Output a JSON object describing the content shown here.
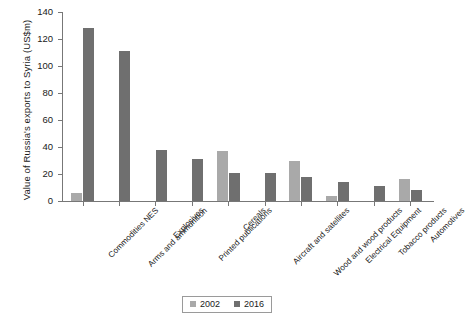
{
  "chart_data": {
    "type": "bar",
    "title": "",
    "xlabel": "",
    "ylabel": "Value of Russia's exports to Syria (US$m)",
    "ylim": [
      0,
      140
    ],
    "yticks": [
      0,
      20,
      40,
      60,
      80,
      100,
      120,
      140
    ],
    "grid": false,
    "legend_position": "bottom-center",
    "categories": [
      "Commodities NES",
      "Arms and ammunition",
      "Explosives",
      "Printed publications",
      "Cereals",
      "Aircraft and satellites",
      "Wood and wood products",
      "Electrical Equipment",
      "Tobacco products",
      "Automotives"
    ],
    "series": [
      {
        "name": "2002",
        "color": "#a9a9a9",
        "values": [
          6,
          0,
          0,
          0,
          37,
          0,
          30,
          4,
          0,
          16
        ]
      },
      {
        "name": "2016",
        "color": "#6f6f6f",
        "values": [
          128,
          111,
          38,
          31,
          21,
          21,
          18,
          14,
          11,
          8
        ]
      }
    ]
  },
  "legend": {
    "items": [
      {
        "label": "2002",
        "color": "#a9a9a9"
      },
      {
        "label": "2016",
        "color": "#6f6f6f"
      }
    ]
  },
  "axes": {
    "y_title": "Value of Russia's exports to Syria (US$m)",
    "axis_color": "#777777"
  }
}
